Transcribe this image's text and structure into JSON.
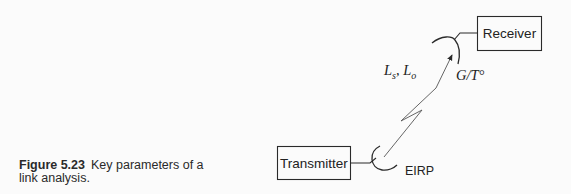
{
  "caption": {
    "figure_number": "Figure 5.23",
    "text": "Key parameters of a link analysis."
  },
  "diagram": {
    "transmitter": {
      "label": "Transmitter"
    },
    "receiver": {
      "label": "Receiver"
    },
    "labels": {
      "eirp": "EIRP",
      "losses_Ls": "L",
      "losses_Ls_sub": "s",
      "losses_sep": ", L",
      "losses_Lo_sub": "o",
      "gt": "G/T°"
    },
    "colors": {
      "stroke": "#2a2a2a",
      "background": "#fbfbfb"
    }
  }
}
